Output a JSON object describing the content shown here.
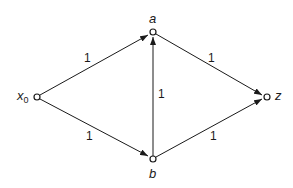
{
  "graph": {
    "nodes": [
      {
        "id": "x0",
        "label": "x",
        "subscript": "0",
        "x": 37,
        "y": 97
      },
      {
        "id": "a",
        "label": "a",
        "x": 153,
        "y": 32
      },
      {
        "id": "b",
        "label": "b",
        "x": 153,
        "y": 159
      },
      {
        "id": "z",
        "label": "z",
        "x": 267,
        "y": 97
      }
    ],
    "edges": [
      {
        "from": "x0",
        "to": "a",
        "weight": "1"
      },
      {
        "from": "x0",
        "to": "b",
        "weight": "1"
      },
      {
        "from": "b",
        "to": "a",
        "weight": "1"
      },
      {
        "from": "a",
        "to": "z",
        "weight": "1"
      },
      {
        "from": "b",
        "to": "z",
        "weight": "1"
      }
    ],
    "colors": {
      "stroke": "#1a1a1a",
      "background": "#ffffff"
    }
  }
}
